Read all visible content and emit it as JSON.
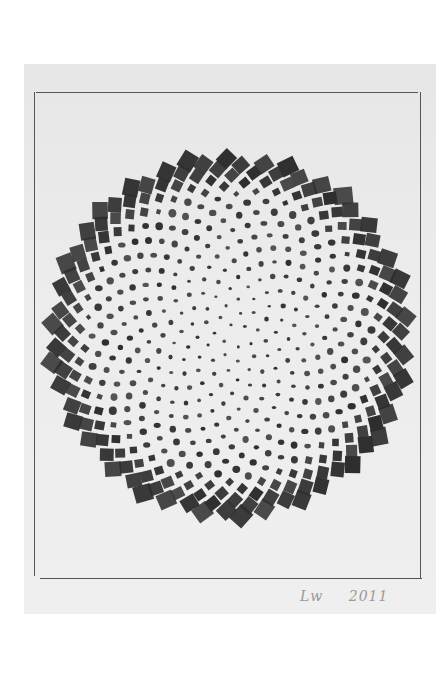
{
  "artwork": {
    "subject": "phyllotaxis spiral drawing (sunflower seed head pattern)",
    "medium": "graphite on paper",
    "signature": {
      "initials": "Lw",
      "year": "2011"
    },
    "colors": {
      "background": "#ffffff",
      "paper": "#eaeaea",
      "ink": "#2e2e2e",
      "frame_line": "#555555",
      "signature": "#9a9a9a"
    },
    "spiral": {
      "center_x": 230,
      "center_y": 336,
      "outer_radius": 180,
      "count": 520,
      "golden_angle_deg": 137.508
    }
  }
}
